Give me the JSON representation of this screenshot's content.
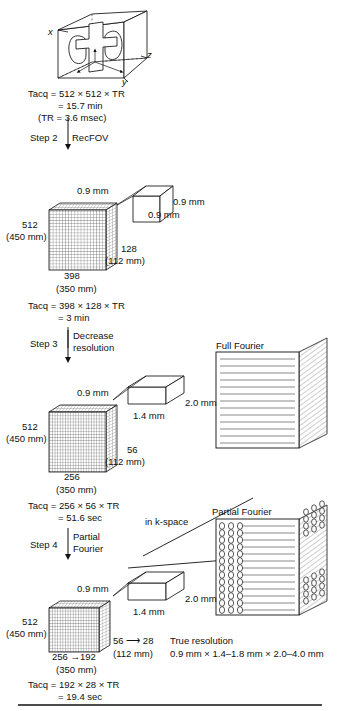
{
  "figure": {
    "title_hidden": "MRI acquisition time reduction workflow",
    "axes": {
      "x": "x",
      "y": "y",
      "z": "z"
    }
  },
  "step1": {
    "tacq_line1": "Tacq = 512 × 512 × TR",
    "tacq_line2": "= 15.7 min",
    "tacq_line3": "(TR = 3.6 msec)"
  },
  "step2": {
    "step_label": "Step 2",
    "action": "RecFOV",
    "voxel": {
      "dim_top": "0.9 mm",
      "dim_right": "0.9 mm",
      "dim_front": "0.9 mm"
    },
    "block": {
      "left_count": "512",
      "left_mm": "(450 mm)",
      "bottom_count": "398",
      "bottom_mm": "(350 mm)",
      "right_count": "128",
      "right_mm": "(112 mm)"
    },
    "tacq_line1": "Tacq = 398 × 128 × TR",
    "tacq_line2": "= 3 min"
  },
  "step3": {
    "step_label": "Step 3",
    "action_line1": "Decrease",
    "action_line2": "resolution",
    "voxel": {
      "dim_top": "0.9 mm",
      "dim_front": "1.4 mm",
      "dim_right": "2.0 mm"
    },
    "block": {
      "left_count": "512",
      "left_mm": "(450 mm)",
      "bottom_count": "256",
      "bottom_mm": "(350 mm)",
      "right_count": "56",
      "right_mm": "(112 mm)"
    },
    "tacq_line1": "Tacq = 256 × 56 × TR",
    "tacq_line2": "= 51.6 sec"
  },
  "step4": {
    "step_label": "Step 4",
    "action_line1": "Partial",
    "action_line2": "Fourier",
    "voxel": {
      "dim_top": "0.9 mm",
      "dim_front": "1.4 mm",
      "dim_right": "2.0 mm"
    },
    "block": {
      "left_count": "512",
      "left_mm": "(450 mm)",
      "bottom_count": "256 →192",
      "bottom_mm": "(350 mm)",
      "right_count": "56 ⟶ 28",
      "right_mm": "(112 mm)"
    },
    "true_resolution_label": "True resolution",
    "true_resolution_value": "0.9 mm × 1.4–1.8 mm × 2.0–4.0 mm",
    "tacq_line1": "Tacq = 192 × 28 × TR",
    "tacq_line2": "= 19.4 sec"
  },
  "kspace": {
    "caption": "in k-space",
    "full_fourier_label": "Full Fourier",
    "partial_fourier_label": "Partial Fourier"
  },
  "colors": {
    "ink": "#111111",
    "line": "#000000",
    "grid": "#555555",
    "kline": "#888888"
  }
}
